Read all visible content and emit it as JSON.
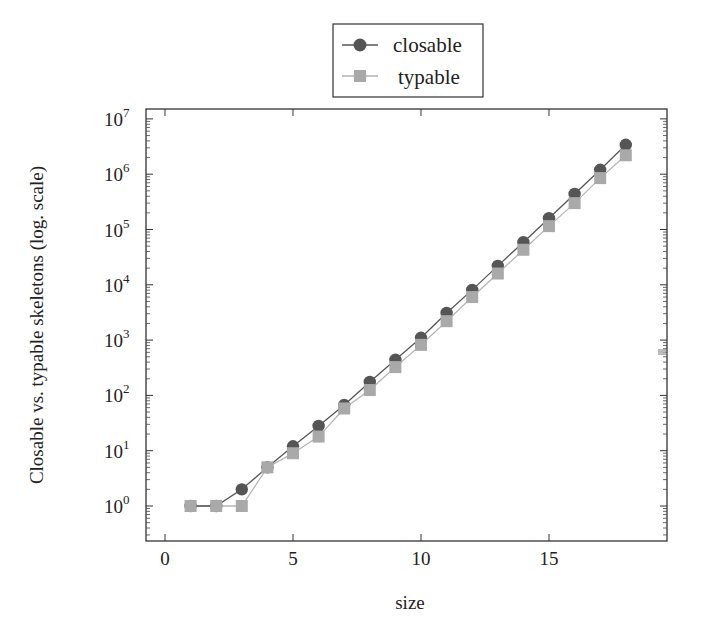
{
  "chart_data": {
    "type": "line",
    "title": "",
    "xlabel": "size",
    "ylabel": "Closable vs. typable skeletons (log. scale)",
    "yscale": "log",
    "xlim": [
      -0.7,
      19.6
    ],
    "ylim": [
      0.25,
      13000000
    ],
    "x_ticks": [
      0,
      5,
      10,
      15
    ],
    "y_ticks": [
      {
        "value": 1,
        "base": "10",
        "exp": "0"
      },
      {
        "value": 10,
        "base": "10",
        "exp": "1"
      },
      {
        "value": 100,
        "base": "10",
        "exp": "2"
      },
      {
        "value": 1000,
        "base": "10",
        "exp": "3"
      },
      {
        "value": 10000,
        "base": "10",
        "exp": "4"
      },
      {
        "value": 100000,
        "base": "10",
        "exp": "5"
      },
      {
        "value": 1000000,
        "base": "10",
        "exp": "6"
      },
      {
        "value": 10000000,
        "base": "10",
        "exp": "7"
      }
    ],
    "grid": false,
    "legend_position": "top-center-outside",
    "x": [
      1,
      2,
      3,
      4,
      5,
      6,
      7,
      8,
      9,
      10,
      11,
      12,
      13,
      14,
      15,
      16,
      17,
      18
    ],
    "series": [
      {
        "name": "closable",
        "marker": "circle",
        "color": "#555555",
        "line_color": "#555555",
        "values": [
          1,
          1,
          2,
          5,
          12,
          28,
          67,
          175,
          440,
          1100,
          3100,
          8100,
          22000,
          59000,
          160000,
          440000,
          1200000,
          3400000
        ]
      },
      {
        "name": "typable",
        "marker": "square",
        "color": "#a9a9a9",
        "line_color": "#b5b5b5",
        "values": [
          1,
          1,
          1,
          5,
          9,
          18,
          58,
          125,
          325,
          820,
          2200,
          6000,
          16000,
          43000,
          115000,
          300000,
          850000,
          2200000
        ]
      }
    ]
  },
  "legend": {
    "items": [
      {
        "label": "closable"
      },
      {
        "label": "typable"
      }
    ]
  },
  "axis": {
    "xlabel": "size",
    "ylabel": "Closable vs. typable skeletons (log. scale)"
  }
}
